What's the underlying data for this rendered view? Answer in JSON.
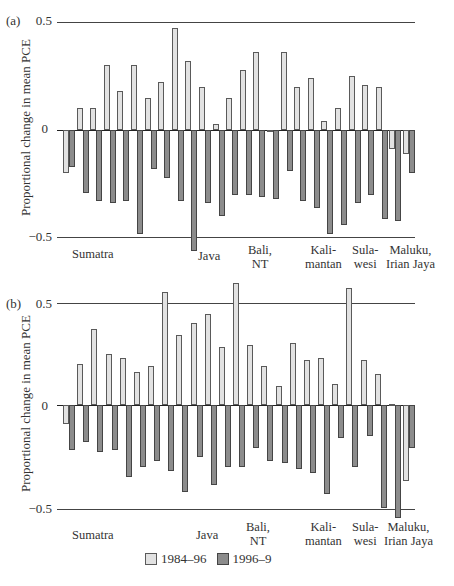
{
  "chart_data": [
    {
      "type": "bar",
      "panel": "(a)",
      "ylabel": "Proportional change in mean PCE",
      "yticks": [
        "0.5",
        "0",
        "−0.5"
      ],
      "ylim": [
        -0.5,
        0.5
      ],
      "grid": "horizontal lines at 0.5, 0, -0.5",
      "region_labels": [
        "Sumatra",
        "Java",
        "Bali,\nNT",
        "Kali-\nmantan",
        "Sula-\nwesi",
        "Maluku,\nIrian Jaya"
      ],
      "series": [
        {
          "name": "1984–96",
          "values": [
            -0.2,
            0.1,
            0.1,
            0.3,
            0.18,
            0.3,
            0.15,
            0.22,
            0.47,
            0.32,
            0.2,
            0.03,
            0.15,
            0.28,
            0.36,
            -0.01,
            0.36,
            0.2,
            0.24,
            0.04,
            0.1,
            0.25,
            0.21,
            0.2,
            -0.09,
            -0.11
          ]
        },
        {
          "name": "1996–9",
          "values": [
            -0.17,
            -0.29,
            -0.33,
            -0.34,
            -0.33,
            -0.48,
            -0.18,
            -0.22,
            -0.33,
            -0.56,
            -0.34,
            -0.4,
            -0.3,
            -0.3,
            -0.31,
            -0.32,
            -0.19,
            -0.33,
            -0.36,
            -0.48,
            -0.44,
            -0.34,
            -0.3,
            -0.41,
            -0.42,
            -0.2
          ]
        }
      ]
    },
    {
      "type": "bar",
      "panel": "(b)",
      "ylabel": "Proportional change in mean PCE",
      "yticks": [
        "0.5",
        "0",
        "−0.5"
      ],
      "ylim": [
        -0.5,
        0.5
      ],
      "grid": "horizontal lines at 0.5, 0, -0.5",
      "region_labels": [
        "Sumatra",
        "Java",
        "Bali,\nNT",
        "Kali-\nmantan",
        "Sula-\nwesi",
        "Maluku,\nIrian Jaya"
      ],
      "series": [
        {
          "name": "1984–96",
          "values": [
            -0.09,
            0.2,
            0.37,
            0.25,
            0.23,
            0.16,
            0.19,
            0.55,
            0.34,
            0.4,
            0.44,
            0.28,
            0.59,
            0.29,
            0.19,
            0.09,
            0.3,
            0.22,
            0.23,
            0.1,
            0.57,
            0.22,
            0.15,
            0.0,
            -0.37
          ]
        },
        {
          "name": "1996–9",
          "values": [
            -0.22,
            -0.18,
            -0.23,
            -0.22,
            -0.35,
            -0.3,
            -0.27,
            -0.32,
            -0.42,
            -0.25,
            -0.39,
            -0.3,
            -0.3,
            -0.21,
            -0.27,
            -0.28,
            -0.31,
            -0.33,
            -0.43,
            -0.16,
            -0.3,
            -0.15,
            -0.5,
            -0.55,
            -0.21
          ]
        }
      ]
    }
  ],
  "panels": {
    "a": {
      "label": "(a)",
      "tick_top": "0.5",
      "tick_zero": "0",
      "tick_bottom": "−0.5",
      "ylabel": "Proportional change in mean PCE"
    },
    "b": {
      "label": "(b)",
      "tick_top": "0.5",
      "tick_zero": "0",
      "tick_bottom": "−0.5",
      "ylabel": "Proportional change in mean PCE"
    }
  },
  "regions": {
    "sumatra": "Sumatra",
    "java": "Java",
    "bali_1": "Bali,",
    "bali_2": "NT",
    "kali_1": "Kali-",
    "kali_2": "mantan",
    "sula_1": "Sula-",
    "sula_2": "wesi",
    "maluku_1": "Maluku,",
    "maluku_2": "Irian Jaya"
  },
  "legend": {
    "series0": "1984–96",
    "series1": "1996–9"
  }
}
